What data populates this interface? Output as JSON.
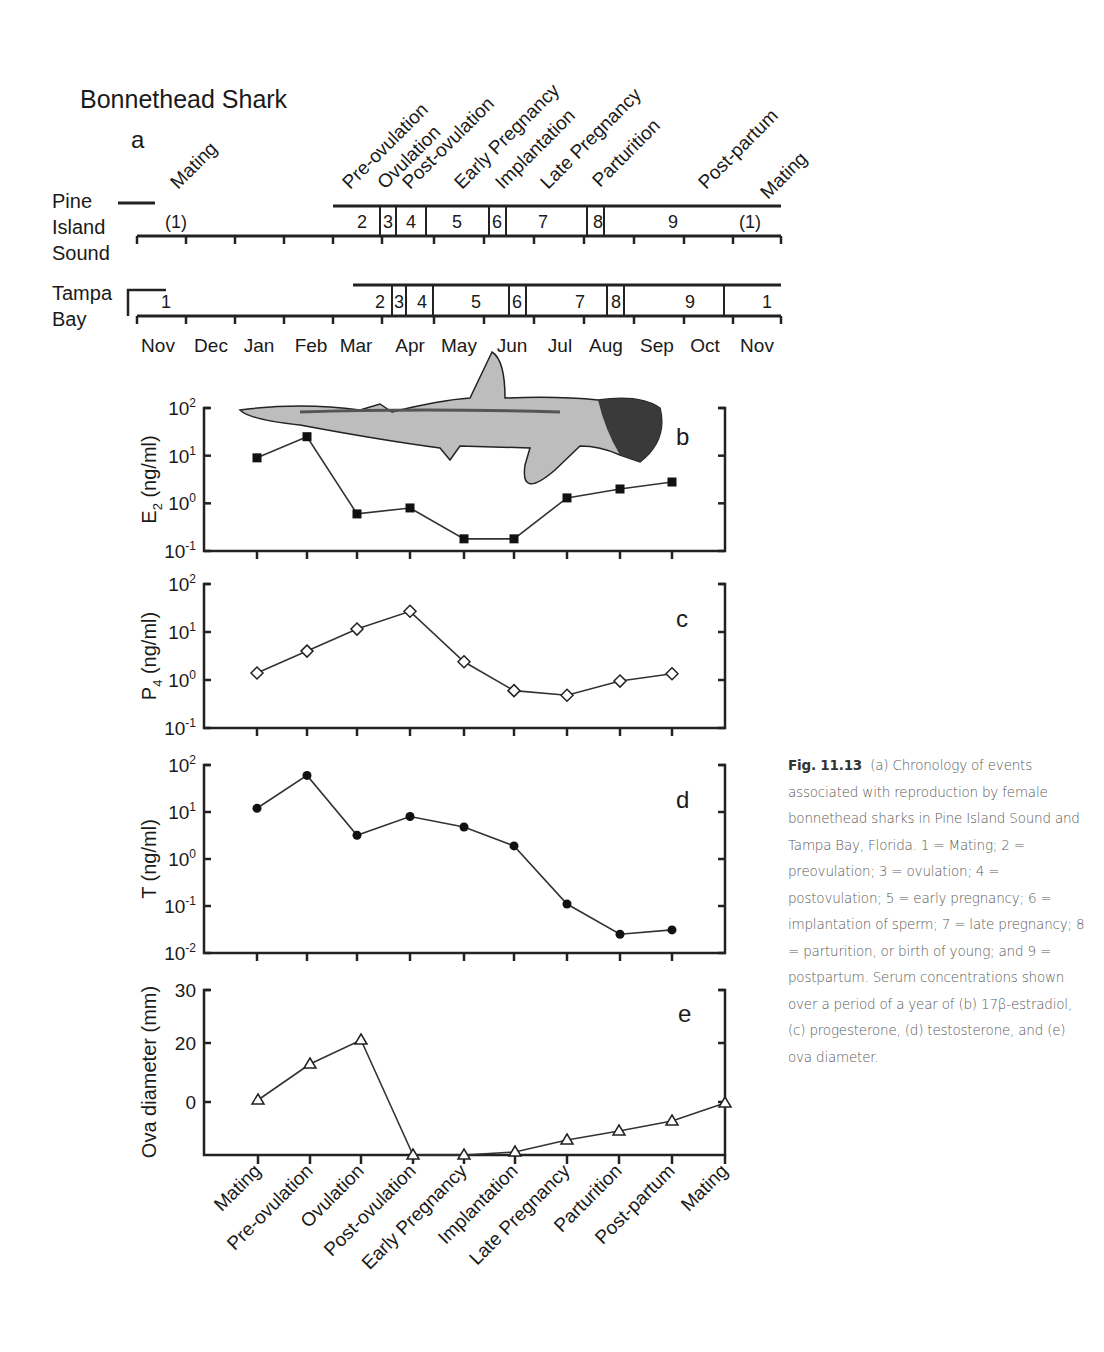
{
  "title": "Bonnethead Shark",
  "panel_a": {
    "label": "a",
    "rows": [
      {
        "name": "Pine Island Sound",
        "lines": [
          "Pine",
          "Island",
          "Sound"
        ]
      },
      {
        "name": "Tampa Bay",
        "lines": [
          "Tampa",
          "Bay"
        ]
      }
    ],
    "months": [
      "Nov",
      "Dec",
      "Jan",
      "Feb",
      "Mar",
      "Apr",
      "May",
      "Jun",
      "Jul",
      "Aug",
      "Sep",
      "Oct",
      "Nov"
    ],
    "stage_labels": [
      "Mating",
      "Pre-ovulation",
      "Ovulation",
      "Post-ovulation",
      "Early Pregnancy",
      "Implantation",
      "Late Pregnancy",
      "Parturition",
      "Post-partum",
      "Mating"
    ],
    "pine_segments": [
      "(1)",
      "2",
      "3",
      "4",
      "5",
      "6",
      "7",
      "8",
      "9",
      "(1)"
    ],
    "tampa_segments": [
      "1",
      "2",
      "3",
      "4",
      "5",
      "6",
      "7",
      "8",
      "9",
      "1"
    ]
  },
  "chart_data": [
    {
      "type": "line",
      "panel": "b",
      "ylabel": "E2 (ng/ml)",
      "yscale": "log",
      "ylim": [
        0.1,
        100
      ],
      "yticks": [
        "10^2",
        "10^1",
        "10^0",
        "10^-1"
      ],
      "categories": [
        "Mating",
        "Pre-ovulation",
        "Ovulation",
        "Post-ovulation",
        "Early Pregnancy",
        "Implantation",
        "Late Pregnancy",
        "Parturition",
        "Post-partum"
      ],
      "marker": "filled-square",
      "values": [
        9,
        25,
        0.6,
        0.8,
        0.18,
        0.18,
        1.3,
        2.0,
        2.8
      ]
    },
    {
      "type": "line",
      "panel": "c",
      "ylabel": "P4 (ng/ml)",
      "yscale": "log",
      "ylim": [
        0.1,
        100
      ],
      "yticks": [
        "10^2",
        "10^1",
        "10^0",
        "10^-1"
      ],
      "categories": [
        "Mating",
        "Pre-ovulation",
        "Ovulation",
        "Post-ovulation",
        "Early Pregnancy",
        "Implantation",
        "Late Pregnancy",
        "Parturition",
        "Post-partum"
      ],
      "marker": "open-diamond",
      "values": [
        1.4,
        4.0,
        11.5,
        27,
        2.4,
        0.6,
        0.48,
        0.95,
        1.35
      ]
    },
    {
      "type": "line",
      "panel": "d",
      "ylabel": "T (ng/ml)",
      "yscale": "log",
      "ylim": [
        0.01,
        100
      ],
      "yticks": [
        "10^2",
        "10^1",
        "10^0",
        "10^-1",
        "10^-2"
      ],
      "categories": [
        "Mating",
        "Pre-ovulation",
        "Ovulation",
        "Post-ovulation",
        "Early Pregnancy",
        "Implantation",
        "Late Pregnancy",
        "Parturition",
        "Post-partum"
      ],
      "marker": "filled-circle",
      "values": [
        12,
        60,
        3.2,
        8,
        4.8,
        1.9,
        0.11,
        0.025,
        0.031
      ]
    },
    {
      "type": "line",
      "panel": "e",
      "ylabel": "Ova diameter (mm)",
      "yticks": [
        "30",
        "20",
        "0"
      ],
      "categories": [
        "Mating",
        "Pre-ovulation",
        "Ovulation",
        "Post-ovulation",
        "Early Pregnancy",
        "Implantation",
        "Late Pregnancy",
        "Parturition",
        "Post-partum",
        "Mating"
      ],
      "marker": "open-triangle",
      "values_px_y": [
        1100,
        1064,
        1040,
        1155,
        1155,
        1152,
        1140,
        1131,
        1121,
        1103
      ],
      "values": [
        0.5,
        13,
        21,
        -18,
        -18,
        -17,
        -10,
        -8.5,
        -4,
        0
      ],
      "xlabels": [
        "Mating",
        "Pre-ovulation",
        "Ovulation",
        "Post-ovulation",
        "Early Pregnancy",
        "Implantation",
        "Late Pregnancy",
        "Parturition",
        "Post-partum",
        "Mating"
      ]
    }
  ],
  "caption": {
    "fig_label": "Fig. 11.13",
    "text": "(a) Chronology of events associated with reproduction by female bonnethead sharks in Pine Island Sound and Tampa Bay, Florida. 1 = Mating; 2 = preovulation; 3 = ovulation; 4 = postovulation; 5 = early pregnancy; 6 = implantation of sperm; 7 = late pregnancy; 8 = parturition, or birth of young; and 9 = postpartum. Serum concentrations shown over a period of a year of (b) 17β-estradiol, (c) progesterone, (d) testosterone, and (e) ova diameter."
  }
}
